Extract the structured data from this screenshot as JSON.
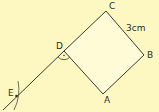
{
  "colors": {
    "background": "#fdf8c2",
    "square_fill": "#fffbd6",
    "stroke": "#3a3a2e"
  },
  "diagram": {
    "type": "geometric-construction",
    "shape": "square",
    "side_label": "3cm",
    "points": {
      "A": {
        "label": "A",
        "x": 103,
        "y": 94
      },
      "B": {
        "label": "B",
        "x": 144,
        "y": 55
      },
      "C": {
        "label": "C",
        "x": 106,
        "y": 11
      },
      "D": {
        "label": "D",
        "x": 64,
        "y": 51
      },
      "E": {
        "label": "E",
        "x": 16,
        "y": 96
      }
    },
    "right_angle_marker_at": "D",
    "construction_arc_at": "E"
  }
}
